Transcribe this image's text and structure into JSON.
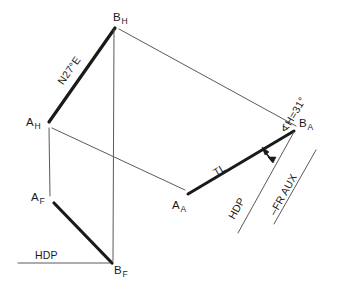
{
  "drawing": {
    "type": "descriptive-geometry-line-problem",
    "stroke_color": "#1a1a1a",
    "thin_stroke_color": "#4a4a4a",
    "background": "#ffffff",
    "points": {
      "a_h": {
        "base": "A",
        "sub": "H",
        "x": 42,
        "y": 125
      },
      "b_h": {
        "base": "B",
        "sub": "H",
        "x": 113,
        "y": 25
      },
      "a_f": {
        "base": "A",
        "sub": "F",
        "x": 47,
        "y": 200
      },
      "b_f": {
        "base": "B",
        "sub": "F",
        "x": 113,
        "y": 265
      },
      "a_a": {
        "base": "A",
        "sub": "A",
        "x": 183,
        "y": 192
      },
      "b_a": {
        "base": "B",
        "sub": "A",
        "x": 296,
        "y": 128
      }
    },
    "labels": {
      "bearing": "N27°E",
      "true_length": "TL",
      "angle": "∢H=31°",
      "hdp_front": "HDP",
      "hdp_aux": "HDP",
      "fr_aux": "–FR AUX"
    },
    "point_labels": {
      "a_h": "A",
      "a_h_sub": "H",
      "b_h": "B",
      "b_h_sub": "H",
      "a_f": "A",
      "a_f_sub": "F",
      "b_f": "B",
      "b_f_sub": "F",
      "a_a": "A",
      "a_a_sub": "A",
      "b_a": "B",
      "b_a_sub": "A"
    }
  }
}
